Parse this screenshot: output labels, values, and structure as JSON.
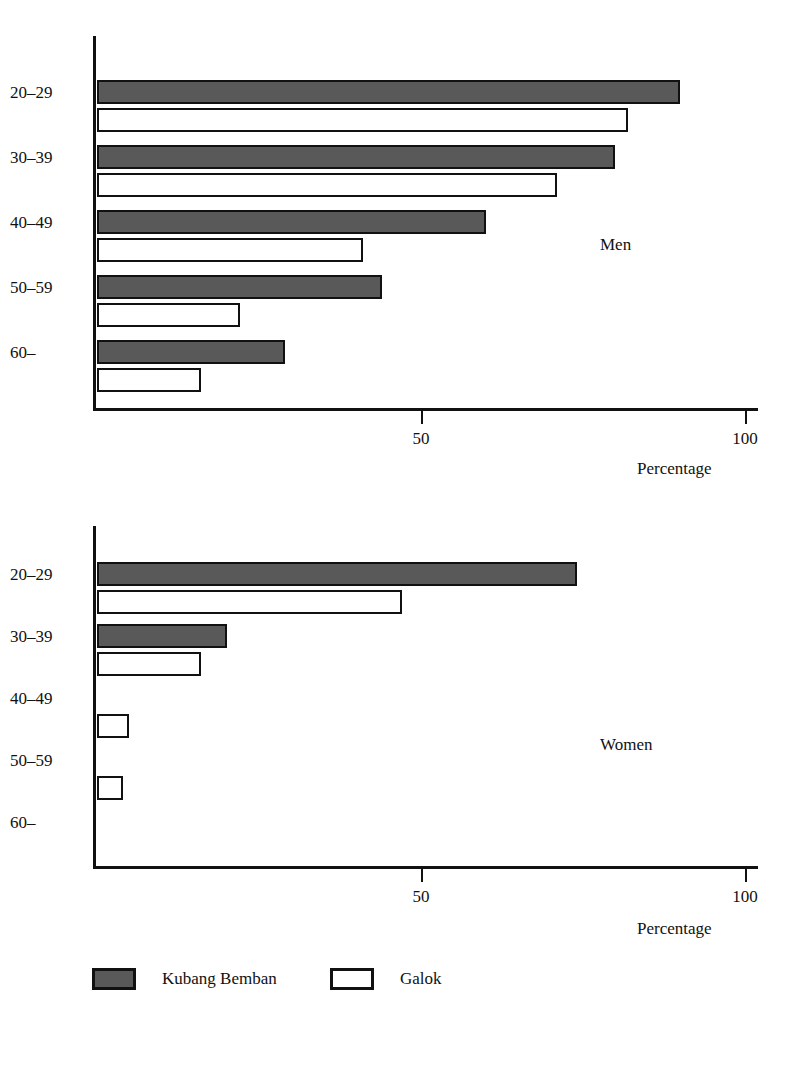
{
  "chart_data": [
    {
      "type": "bar",
      "title": "Men",
      "orientation": "horizontal",
      "xlabel": "Percentage",
      "ylabel": "",
      "xlim": [
        0,
        105
      ],
      "xticks": [
        50,
        100
      ],
      "xtick_labels": [
        "50",
        "100"
      ],
      "grid": false,
      "categories": [
        "20–29",
        "30–39",
        "40–49",
        "50–59",
        "60–"
      ],
      "series": [
        {
          "name": "Kubang Bemban",
          "values": [
            90,
            80,
            60,
            44,
            29
          ]
        },
        {
          "name": "Galok",
          "values": [
            82,
            71,
            41,
            22,
            16
          ]
        }
      ],
      "legend_position": "bottom"
    },
    {
      "type": "bar",
      "title": "Women",
      "orientation": "horizontal",
      "xlabel": "Percentage",
      "ylabel": "",
      "xlim": [
        0,
        105
      ],
      "xticks": [
        50,
        100
      ],
      "xtick_labels": [
        "50",
        "100"
      ],
      "grid": false,
      "categories": [
        "20–29",
        "30–39",
        "40–49",
        "50–59",
        "60–"
      ],
      "series": [
        {
          "name": "Kubang Bemban",
          "values": [
            74,
            20,
            0,
            0,
            0
          ]
        },
        {
          "name": "Galok",
          "values": [
            47,
            16,
            5,
            4,
            0
          ]
        }
      ],
      "legend_position": "bottom"
    }
  ],
  "panels": [
    {
      "id": "men",
      "label": "Men",
      "axis_title": "Percentage",
      "categories": [
        "20–29",
        "30–39",
        "40–49",
        "50–59",
        "60–"
      ],
      "xtick_labels": [
        "50",
        "100"
      ],
      "bars": [
        {
          "category": "20–29",
          "series": "Kubang Bemban",
          "value": 90
        },
        {
          "category": "20–29",
          "series": "Galok",
          "value": 82
        },
        {
          "category": "30–39",
          "series": "Kubang Bemban",
          "value": 80
        },
        {
          "category": "30–39",
          "series": "Galok",
          "value": 71
        },
        {
          "category": "40–49",
          "series": "Kubang Bemban",
          "value": 60
        },
        {
          "category": "40–49",
          "series": "Galok",
          "value": 41
        },
        {
          "category": "50–59",
          "series": "Kubang Bemban",
          "value": 44
        },
        {
          "category": "50–59",
          "series": "Galok",
          "value": 22
        },
        {
          "category": "60–",
          "series": "Kubang Bemban",
          "value": 29
        },
        {
          "category": "60–",
          "series": "Galok",
          "value": 16
        }
      ]
    },
    {
      "id": "women",
      "label": "Women",
      "axis_title": "Percentage",
      "categories": [
        "20–29",
        "30–39",
        "40–49",
        "50–59",
        "60–"
      ],
      "xtick_labels": [
        "50",
        "100"
      ],
      "bars": [
        {
          "category": "20–29",
          "series": "Kubang Bemban",
          "value": 74
        },
        {
          "category": "20–29",
          "series": "Galok",
          "value": 47
        },
        {
          "category": "30–39",
          "series": "Kubang Bemban",
          "value": 20
        },
        {
          "category": "30–39",
          "series": "Galok",
          "value": 16
        },
        {
          "category": "40–49",
          "series": "Kubang Bemban",
          "value": 0
        },
        {
          "category": "40–49",
          "series": "Galok",
          "value": 5
        },
        {
          "category": "50–59",
          "series": "Kubang Bemban",
          "value": 0
        },
        {
          "category": "50–59",
          "series": "Galok",
          "value": 4
        },
        {
          "category": "60–",
          "series": "Kubang Bemban",
          "value": 0
        },
        {
          "category": "60–",
          "series": "Galok",
          "value": 0
        }
      ]
    }
  ],
  "legend": {
    "items": [
      {
        "label": "Kubang Bemban",
        "style": "filled",
        "color": "#595959"
      },
      {
        "label": "Galok",
        "style": "open",
        "color": "#ffffff"
      }
    ]
  },
  "caption": "",
  "colors": {
    "filled": "#595959",
    "open": "#ffffff",
    "stroke": "#111111",
    "background": "#ffffff"
  }
}
